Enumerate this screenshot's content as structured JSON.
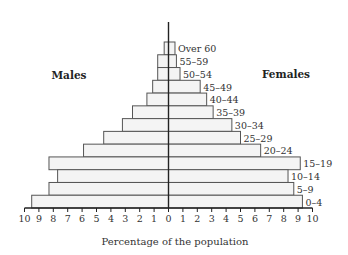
{
  "chart_data": {
    "type": "bar",
    "subtype": "population-pyramid (horizontal, back-to-back)",
    "title": "",
    "xlabel": "Percentage of the population",
    "ylabel": "",
    "xlim": [
      -10,
      10
    ],
    "x_ticks": [
      10,
      9,
      8,
      7,
      6,
      5,
      4,
      3,
      2,
      1,
      0,
      1,
      2,
      3,
      4,
      5,
      6,
      7,
      8,
      9,
      10
    ],
    "grid": false,
    "legend": null,
    "side_labels": {
      "left": "Males",
      "right": "Females"
    },
    "categories": [
      "Over 60",
      "55–59",
      "50–54",
      "45–49",
      "40–44",
      "35–39",
      "30–34",
      "25–29",
      "20–24",
      "15–19",
      "10–14",
      "5–9",
      "0–4"
    ],
    "series": [
      {
        "name": "Males",
        "side": "left",
        "values": [
          0.3,
          0.75,
          0.75,
          1.1,
          1.5,
          2.5,
          3.2,
          4.5,
          5.9,
          8.3,
          7.7,
          8.3,
          9.5
        ]
      },
      {
        "name": "Females",
        "side": "right",
        "values": [
          0.45,
          0.55,
          0.8,
          2.2,
          2.65,
          3.1,
          4.4,
          5.0,
          6.4,
          9.15,
          8.3,
          8.7,
          9.3
        ]
      }
    ],
    "colors": {
      "bar_fill": "#f4f4f4",
      "bar_stroke": "#555555",
      "axis": "#222222"
    }
  }
}
